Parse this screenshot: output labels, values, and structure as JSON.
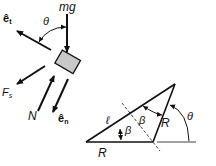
{
  "free_body": {
    "weight_label": "mg",
    "theta_label": "θ",
    "et_label": "ê",
    "et_sub": "t",
    "en_label": "ê",
    "en_sub": "n",
    "friction_label": "F",
    "friction_sub": "s",
    "normal_label": "N",
    "block_color": "#c8c8c8"
  },
  "geometry": {
    "ell_label": "ℓ",
    "beta1_label": "β",
    "beta2_label": "β",
    "R_bottom_label": "R",
    "R_side_label": "R",
    "theta_label": "θ"
  }
}
